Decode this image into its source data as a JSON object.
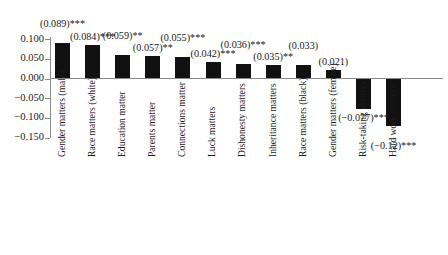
{
  "chart_data": {
    "type": "bar",
    "title": "",
    "subtitle": "",
    "xlabel": "",
    "ylabel": "",
    "ylim": [
      -0.15,
      0.1
    ],
    "grid": false,
    "legend": null,
    "orientation": "vertical",
    "bar_color": "#111111",
    "axis_color": "#8a8a8a",
    "categories": [
      "Gender matters (male)",
      "Race matters (white)",
      "Education matter",
      "Parents matter",
      "Connections matter",
      "Luck matters",
      "Dishonesty matters",
      "Inheritance matters",
      "Race matters (black)",
      "Gender matters (female)",
      "Risk-taking matters",
      "Hard work matters"
    ],
    "values": [
      0.089,
      0.084,
      0.059,
      0.057,
      0.055,
      0.042,
      0.036,
      0.035,
      0.033,
      0.021,
      -0.077,
      -0.12
    ],
    "annotations": [
      "(0.089)***",
      "(0.084)***",
      "(0.059)**",
      "(0.057)**",
      "(0.055)***",
      "(0.042)***",
      "(0.036)***",
      "(0.035)**",
      "(0.033)",
      "(0.021)",
      "(−0.077)***",
      "(−0.12)***"
    ],
    "yticks": [
      0.1,
      0.05,
      0.0,
      -0.05,
      -0.1,
      -0.15
    ],
    "ytick_labels": [
      "0.100",
      "0.050",
      "0.000",
      "−0.050",
      "−0.100",
      "−0.150"
    ]
  }
}
